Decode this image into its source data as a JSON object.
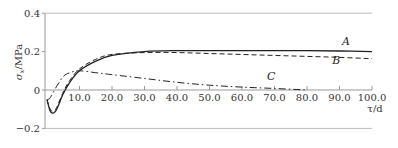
{
  "chart_data": {
    "type": "line",
    "title": "",
    "xlabel": "τ/d",
    "ylabel": "σx/MPa",
    "xlim": [
      0,
      100
    ],
    "ylim": [
      -0.2,
      0.4
    ],
    "grid": false,
    "x_ticks": [
      10,
      20,
      30,
      40,
      50,
      60,
      70,
      80,
      90,
      100
    ],
    "x_tick_labels": [
      "10.0",
      "20.0",
      "30.0",
      "40.0",
      "50.0",
      "60.0",
      "70.0",
      "80.0",
      "90.0",
      "100.0"
    ],
    "y_ticks": [
      0.4,
      0.2,
      0,
      -0.2
    ],
    "y_tick_labels": [
      "0.4",
      "0.2",
      "0",
      "−0.2"
    ],
    "legend": null,
    "series": [
      {
        "name": "A",
        "style": "solid",
        "x": [
          0,
          1,
          2,
          3,
          5,
          7,
          10,
          15,
          20,
          30,
          40,
          50,
          60,
          70,
          80,
          90,
          100
        ],
        "y": [
          -0.05,
          -0.11,
          -0.12,
          -0.1,
          -0.02,
          0.04,
          0.1,
          0.15,
          0.18,
          0.2,
          0.205,
          0.205,
          0.205,
          0.205,
          0.205,
          0.203,
          0.2
        ]
      },
      {
        "name": "B",
        "style": "dashed",
        "x": [
          0,
          1,
          2,
          3,
          5,
          7,
          10,
          15,
          20,
          30,
          40,
          50,
          60,
          70,
          80,
          90,
          100
        ],
        "y": [
          -0.05,
          -0.1,
          -0.11,
          -0.09,
          -0.01,
          0.05,
          0.11,
          0.16,
          0.185,
          0.195,
          0.195,
          0.19,
          0.185,
          0.18,
          0.175,
          0.17,
          0.163
        ]
      },
      {
        "name": "C",
        "style": "dash-dot",
        "x": [
          0,
          1,
          3,
          5,
          7,
          10,
          15,
          20,
          30,
          40,
          50,
          60,
          70,
          80
        ],
        "y": [
          -0.05,
          -0.04,
          0.02,
          0.07,
          0.09,
          0.1,
          0.09,
          0.08,
          0.06,
          0.04,
          0.025,
          0.015,
          0.008,
          0.0
        ]
      }
    ],
    "annotations": [
      {
        "text": "A",
        "x": 92,
        "y": 0.235
      },
      {
        "text": "B",
        "x": 89,
        "y": 0.135
      },
      {
        "text": "C",
        "x": 69,
        "y": 0.05
      }
    ]
  }
}
